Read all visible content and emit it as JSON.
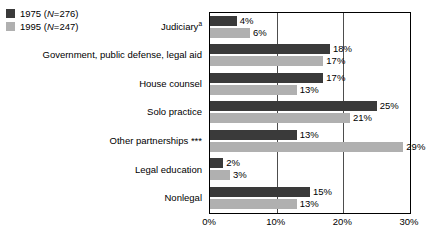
{
  "chart_data": {
    "type": "bar",
    "orientation": "horizontal",
    "title": "",
    "xlabel": "",
    "ylabel": "",
    "xlim": [
      0,
      30
    ],
    "xticks": [
      "0%",
      "10%",
      "20%",
      "30%"
    ],
    "xtick_values": [
      0,
      10,
      20,
      30
    ],
    "grid": true,
    "grid_axis": "x",
    "legend_position": "top-left",
    "categories": [
      "Judiciary",
      "Government, public defense, legal aid",
      "House counsel",
      "Solo practice",
      "Other partnerships",
      "Legal education",
      "Nonlegal"
    ],
    "category_labels": [
      {
        "text": "Judiciary",
        "superscript": "a",
        "stars": ""
      },
      {
        "text": "Government, public defense, legal aid",
        "superscript": "",
        "stars": ""
      },
      {
        "text": "House counsel",
        "superscript": "",
        "stars": ""
      },
      {
        "text": "Solo practice",
        "superscript": "",
        "stars": ""
      },
      {
        "text": "Other partnerships ",
        "superscript": "",
        "stars": "***"
      },
      {
        "text": "Legal education",
        "superscript": "",
        "stars": ""
      },
      {
        "text": "Nonlegal",
        "superscript": "",
        "stars": ""
      }
    ],
    "series": [
      {
        "name": "1975 (N=276)",
        "year": "1975",
        "n": "276",
        "color": "#3a3a3a",
        "values": [
          4,
          18,
          17,
          25,
          13,
          2,
          15
        ],
        "labels": [
          "4%",
          "18%",
          "17%",
          "25%",
          "13%",
          "2%",
          "15%"
        ]
      },
      {
        "name": "1995 (N=247)",
        "year": "1995",
        "n": "247",
        "color": "#b0b0b0",
        "values": [
          6,
          17,
          13,
          21,
          29,
          3,
          13
        ],
        "labels": [
          "6%",
          "17%",
          "13%",
          "21%",
          "29%",
          "3%",
          "13%"
        ]
      }
    ]
  },
  "legend": {
    "items": [
      {
        "year": "1975",
        "n_text": "(N=276)",
        "n_prefix": "N",
        "n_suffix": "=276"
      },
      {
        "year": "1995",
        "n_text": "(N=247)",
        "n_prefix": "N",
        "n_suffix": "=247"
      }
    ]
  },
  "note": {
    "text": ""
  }
}
